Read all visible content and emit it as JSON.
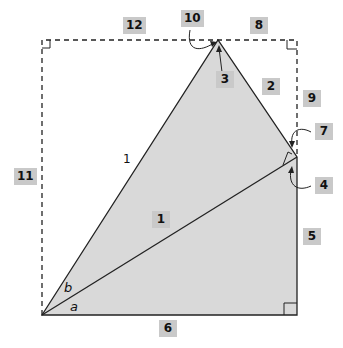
{
  "diagram": {
    "labels": {
      "l1_box": "1",
      "l2": "2",
      "l3": "3",
      "l4": "4",
      "l5": "5",
      "l6": "6",
      "l7": "7",
      "l8": "8",
      "l9": "9",
      "l10": "10",
      "l11": "11",
      "l12": "12"
    },
    "side_label_hypotenuse": "1",
    "angle_a": "a",
    "angle_b": "b",
    "colors": {
      "fill": "#d9d9d9",
      "label_bg": "#c9c9c9",
      "stroke": "#222222"
    }
  }
}
